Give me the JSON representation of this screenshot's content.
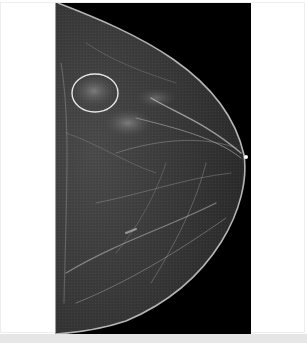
{
  "image": {
    "subject": "mammogram",
    "view": "craniocaudal",
    "annotation": {
      "shape": "circle",
      "color": "#e8e8e8",
      "label": "circled region of interest"
    },
    "colors": {
      "background": "#ffffff",
      "film": "#000000",
      "tissue": "#3a3a3a",
      "skin_line": "#d8d8d8",
      "bottom_strip": "#e6e6e6"
    }
  }
}
